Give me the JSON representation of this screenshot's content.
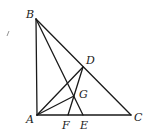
{
  "diagram": {
    "type": "geometry",
    "points": {
      "A": {
        "x": 37,
        "y": 115,
        "label": "A",
        "lx": 26,
        "ly": 123
      },
      "B": {
        "x": 36,
        "y": 19,
        "label": "B",
        "lx": 26,
        "ly": 18
      },
      "C": {
        "x": 131,
        "y": 115,
        "label": "C",
        "lx": 134,
        "ly": 121
      },
      "D": {
        "x": 83,
        "y": 67,
        "label": "D",
        "lx": 86,
        "ly": 64
      },
      "E": {
        "x": 83,
        "y": 115,
        "label": "E",
        "lx": 80,
        "ly": 129
      },
      "F": {
        "x": 68,
        "y": 115,
        "label": "F",
        "lx": 62,
        "ly": 129
      },
      "G": {
        "x": 74,
        "y": 96,
        "label": "G",
        "lx": 79,
        "ly": 98
      }
    },
    "segments": [
      [
        "A",
        "B"
      ],
      [
        "B",
        "C"
      ],
      [
        "A",
        "C"
      ],
      [
        "B",
        "E"
      ],
      [
        "A",
        "D"
      ],
      [
        "F",
        "D"
      ],
      [
        "A",
        "G"
      ]
    ],
    "stray_mark": {
      "x1": 7,
      "y1": 36,
      "x2": 9,
      "y2": 31
    }
  }
}
